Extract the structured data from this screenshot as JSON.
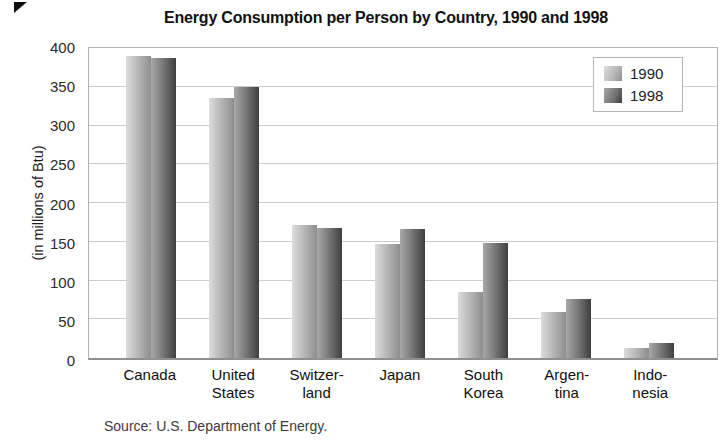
{
  "title": "Energy Consumption per Person by Country, 1990 and 1998",
  "y_axis": {
    "label": "(in millions of Btu)",
    "ticks": [
      400,
      350,
      300,
      250,
      200,
      150,
      100,
      50,
      0
    ]
  },
  "legend": {
    "items": [
      {
        "label": "1990"
      },
      {
        "label": "1998"
      }
    ]
  },
  "source": "Source: U.S. Department of Energy.",
  "colors": {
    "bar_1990_gradient": [
      "#dcdcdc",
      "#b9b9b9",
      "#8e8e8e"
    ],
    "bar_1998_gradient": [
      "#a9a9a9",
      "#757575",
      "#3f3f3f"
    ],
    "gridline": "#cccccc",
    "plot_border": "#b2b2b2",
    "text": "#1a1a1a"
  },
  "chart_data": {
    "type": "bar",
    "title": "Energy Consumption per Person by Country, 1990 and 1998",
    "categories": [
      "Canada",
      "United States",
      "Switzerland",
      "Japan",
      "South Korea",
      "Argentina",
      "Indonesia"
    ],
    "category_labels": [
      [
        "Canada"
      ],
      [
        "United",
        "States"
      ],
      [
        "Switzer-",
        "land"
      ],
      [
        "Japan"
      ],
      [
        "South",
        "Korea"
      ],
      [
        "Argen-",
        "tina"
      ],
      [
        "Indo-",
        "nesia"
      ]
    ],
    "series": [
      {
        "name": "1990",
        "values": [
          390,
          335,
          172,
          147,
          85,
          60,
          13
        ]
      },
      {
        "name": "1998",
        "values": [
          387,
          350,
          168,
          167,
          149,
          76,
          19
        ]
      }
    ],
    "xlabel": "",
    "ylabel": "(in millions of Btu)",
    "ylim": [
      0,
      400
    ],
    "ytick_step": 50,
    "grid": true,
    "legend_position": "top-right",
    "source": "U.S. Department of Energy"
  }
}
